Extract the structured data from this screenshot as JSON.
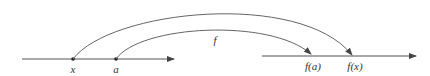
{
  "diagram": {
    "type": "function-mapping",
    "colors": {
      "line": "#555555",
      "point": "#222222",
      "text": "#333333",
      "background": "#ffffff"
    },
    "domain_axis": {
      "y": 59,
      "x_start": 22,
      "x_end": 174,
      "points": [
        {
          "id": "x",
          "label": "x",
          "px": 73
        },
        {
          "id": "a",
          "label": "a",
          "px": 116
        }
      ]
    },
    "codomain_axis": {
      "y": 56,
      "x_start": 262,
      "x_end": 416,
      "points": [
        {
          "id": "fa",
          "label": "f(a)",
          "px": 311
        },
        {
          "id": "fx",
          "label": "f(x)",
          "px": 352
        }
      ]
    },
    "mapping_label": "f",
    "arrows": [
      {
        "from": "x",
        "to": "f(x)"
      },
      {
        "from": "a",
        "to": "f(a)"
      }
    ]
  }
}
